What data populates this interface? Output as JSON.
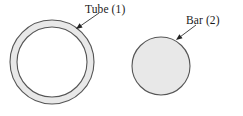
{
  "figure": {
    "width": 243,
    "height": 116,
    "background_color": "#ffffff",
    "shapes": {
      "tube": {
        "label": "Tube (1)",
        "type": "annulus",
        "center_x": 52,
        "center_y": 62,
        "outer_radius": 42,
        "inner_radius": 35,
        "wall_fill_color": "#e8e8e8",
        "interior_fill_color": "#ffffff",
        "stroke_color": "#555555",
        "stroke_width": 1.1
      },
      "bar": {
        "label": "Bar (2)",
        "type": "circle",
        "center_x": 161,
        "center_y": 66,
        "radius": 29,
        "fill_color": "#e8e8e8",
        "stroke_color": "#555555",
        "stroke_width": 1.1
      }
    },
    "leaders": {
      "tube_arrow": {
        "from_x": 99,
        "from_y": 13,
        "to_x": 76,
        "to_y": 29,
        "stroke_color": "#333333",
        "stroke_width": 0.9
      },
      "bar_arrow": {
        "from_x": 196,
        "from_y": 25,
        "to_x": 176,
        "to_y": 40,
        "stroke_color": "#333333",
        "stroke_width": 0.9
      }
    }
  }
}
